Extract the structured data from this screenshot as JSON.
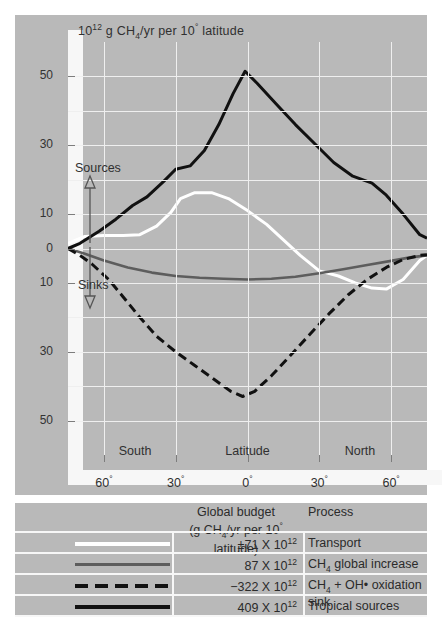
{
  "chart_data": {
    "type": "line",
    "title": "",
    "unit_label": "10^12 g CH4/yr per 10 deg latitude",
    "xlabel": "Latitude",
    "ylabel": "",
    "xlim": [
      -75,
      75
    ],
    "ylim": [
      -60,
      60
    ],
    "grid": true,
    "x_ticks": [
      -60,
      -30,
      0,
      30,
      60
    ],
    "x_tick_labels": [
      "60°",
      "30°",
      "0°",
      "30°",
      "60°"
    ],
    "x_region_labels": [
      "South",
      "Latitude",
      "North"
    ],
    "y_ticks": [
      -50,
      -30,
      -10,
      0,
      10,
      30,
      50
    ],
    "y_tick_labels": [
      "50",
      "30",
      "10",
      "0",
      "10",
      "30",
      "50"
    ],
    "y_minor_ticks": [
      -40,
      -20,
      20,
      40
    ],
    "annotations": [
      {
        "text": "Sources",
        "direction": "up",
        "at": [
          -70,
          18
        ]
      },
      {
        "text": "Sinks",
        "direction": "down",
        "at": [
          -70,
          -18
        ]
      }
    ],
    "series": [
      {
        "name": "Transport",
        "key": "transport",
        "color": "#ffffff",
        "style": "solid",
        "budget": "±71 X 10¹²",
        "x": [
          -75,
          -68,
          -60,
          -52,
          -45,
          -38,
          -32,
          -28,
          -22,
          -15,
          -8,
          0,
          8,
          15,
          22,
          30,
          38,
          45,
          52,
          58,
          65,
          72,
          75
        ],
        "y": [
          1.5,
          3.5,
          3.8,
          3.8,
          4.0,
          6.5,
          10.5,
          14.5,
          16.2,
          16.2,
          14.5,
          11.0,
          7.0,
          2.5,
          -2.0,
          -6.5,
          -8.0,
          -10.0,
          -11.5,
          -11.8,
          -9.0,
          -3.5,
          -2.0
        ]
      },
      {
        "name": "CH4 global increase",
        "key": "global_increase",
        "color": "#5d5d5d",
        "style": "solid",
        "budget": "87 X 10¹²",
        "x": [
          -75,
          -68,
          -60,
          -50,
          -40,
          -30,
          -20,
          -10,
          0,
          10,
          20,
          30,
          40,
          50,
          60,
          68,
          75
        ],
        "y": [
          0.0,
          -1.5,
          -3.5,
          -5.5,
          -7.0,
          -8.0,
          -8.5,
          -8.8,
          -9.0,
          -8.8,
          -8.2,
          -7.2,
          -6.0,
          -4.8,
          -3.6,
          -2.6,
          -2.0
        ]
      },
      {
        "name": "CH4 + OH• oxidation sink",
        "key": "oxidation_sink",
        "color": "#111111",
        "style": "dashed",
        "budget": "−322 X 10¹²",
        "x": [
          -75,
          -70,
          -65,
          -58,
          -52,
          -45,
          -38,
          -30,
          -22,
          -14,
          -7,
          -2,
          3,
          10,
          18,
          26,
          34,
          42,
          50,
          58,
          65,
          72,
          75
        ],
        "y": [
          0.0,
          -2.0,
          -4.5,
          -9.0,
          -14.0,
          -20.0,
          -25.5,
          -30.0,
          -34.0,
          -38.0,
          -41.5,
          -43.0,
          -41.5,
          -37.0,
          -31.0,
          -25.0,
          -19.0,
          -13.5,
          -9.0,
          -5.5,
          -3.2,
          -2.0,
          -1.8
        ]
      },
      {
        "name": "Tropical sources",
        "key": "tropical_sources",
        "color": "#111111",
        "style": "solid",
        "budget": "409 X 10¹²",
        "x": [
          -75,
          -70,
          -62,
          -55,
          -48,
          -42,
          -35,
          -30,
          -24,
          -18,
          -12,
          -6,
          -1,
          4,
          12,
          20,
          28,
          36,
          44,
          52,
          58,
          65,
          72,
          75
        ],
        "y": [
          0.0,
          1.5,
          5.0,
          8.5,
          12.5,
          15.0,
          19.5,
          23.0,
          24.0,
          28.5,
          36.0,
          45.0,
          51.5,
          48.0,
          42.0,
          36.0,
          30.5,
          25.0,
          21.0,
          19.0,
          15.5,
          10.0,
          4.0,
          3.0
        ]
      }
    ]
  },
  "legend": {
    "header_budget_line1": "Global budget",
    "header_budget_line2": "(g CH4/yr per 10° latitude)",
    "header_process": "Process",
    "rows": [
      {
        "swatch": "solid-white",
        "budget": "±71 X 10",
        "exp": "12",
        "process": "Transport"
      },
      {
        "swatch": "solid-gray",
        "budget": "87 X 10",
        "exp": "12",
        "process": "CH4 global increase"
      },
      {
        "swatch": "dashed-black",
        "budget": "−322 X 10",
        "exp": "12",
        "process": "CH4 + OH• oxidation sink"
      },
      {
        "swatch": "solid-black",
        "budget": "409 X 10",
        "exp": "12",
        "process": "Tropical sources"
      }
    ]
  },
  "axis": {
    "unit_prefix": "10",
    "unit_exp": "12",
    "unit_mid": " g CH",
    "unit_sub": "4",
    "unit_suffix": "/yr per 10",
    "unit_deg": "°",
    "unit_tail": " latitude"
  },
  "colors": {
    "panel_bg": "#b9b9b9",
    "frame": "#f7f7f7",
    "gridline": "#efefef",
    "transport": "#ffffff",
    "global_increase": "#5d5d5d",
    "oxidation_sink": "#111111",
    "tropical_sources": "#111111"
  }
}
